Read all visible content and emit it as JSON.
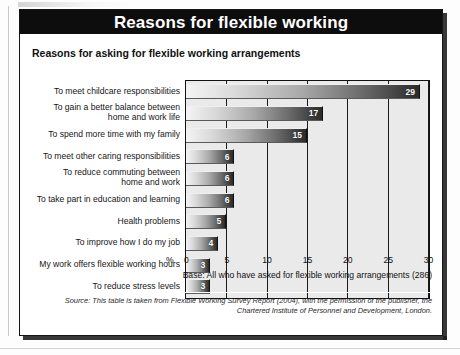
{
  "figure": {
    "title": "Reasons for flexible working",
    "subtitle": "Reasons for asking for flexible working arrangements",
    "base_note": "Base: All who have asked for flexible working arrangements (286)",
    "source_note": "Source: This table is taken from Flexible Working Survey Report (2004), with the permission of the publisher, the Chartered Institute of Personnel and Development, London.",
    "percent_symbol": "%"
  },
  "chart_data": {
    "type": "bar",
    "orientation": "horizontal",
    "title": "Reasons for flexible working",
    "subtitle": "Reasons for asking for flexible working arrangements",
    "xlabel": "%",
    "ylabel": "",
    "xlim": [
      0,
      30
    ],
    "xticks": [
      0,
      5,
      10,
      15,
      20,
      25,
      30
    ],
    "xtick_labels": [
      "0",
      "5",
      "10",
      "15",
      "20",
      "25",
      "30"
    ],
    "grid": true,
    "legend": false,
    "categories": [
      "To meet childcare responsibilities",
      "To gain a better balance between\nhome and work life",
      "To spend more time with my family",
      "To meet other caring responsibilities",
      "To reduce commuting between\nhome and work",
      "To take part in education and learning",
      "Health problems",
      "To improve how I do my job",
      "My work offers flexible working hours",
      "To reduce stress levels"
    ],
    "values": [
      29,
      17,
      15,
      6,
      6,
      6,
      5,
      4,
      3,
      3
    ],
    "value_labels": [
      "29",
      "17",
      "15",
      "6",
      "6",
      "6",
      "5",
      "4",
      "3",
      "3"
    ],
    "annotations": [
      "Base: All who have asked for flexible working arrangements (286)",
      "Source: This table is taken from Flexible Working Survey Report (2004), with the permission of the publisher, the Chartered Institute of Personnel and Development, London."
    ],
    "colors": {
      "bar_gradient_start": "#f4f4f4",
      "bar_gradient_end": "#2a2a2a",
      "plot_background": "#eaeaea",
      "title_bar_background": "#0d0d0d",
      "title_text": "#ffffff",
      "axis_line": "#111111",
      "value_label": "#ffffff"
    }
  }
}
